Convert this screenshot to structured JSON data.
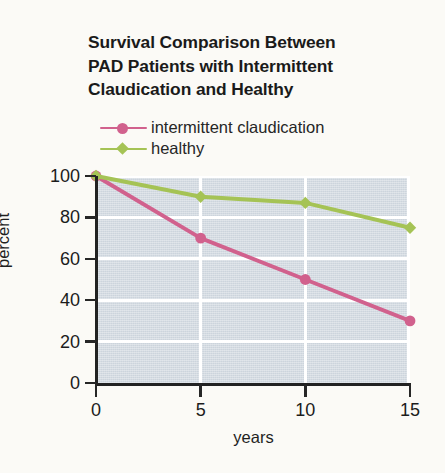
{
  "figure": {
    "background_color": "#fbfaf6"
  },
  "title": {
    "lines": [
      "Survival Comparison Between",
      "PAD Patients with Intermittent",
      "Claudication and Healthy"
    ],
    "full": "Survival Comparison Between PAD Patients with Intermittent Claudication and Healthy"
  },
  "legend": {
    "position": "above-plot-left",
    "entries": [
      {
        "label": "intermittent claudication",
        "color": "#d1618d",
        "marker": "circle"
      },
      {
        "label": "healthy",
        "color": "#a5c355",
        "marker": "diamond"
      }
    ]
  },
  "axes": {
    "x": {
      "label": "years",
      "ticks": [
        "0",
        "5",
        "10",
        "15"
      ],
      "values": [
        0,
        5,
        10,
        15
      ],
      "range": [
        0,
        15
      ]
    },
    "y": {
      "label": "percent",
      "ticks": [
        "0",
        "20",
        "40",
        "60",
        "80",
        "100"
      ],
      "values": [
        0,
        20,
        40,
        60,
        80,
        100
      ],
      "range": [
        0,
        100
      ]
    }
  },
  "plot_style": {
    "panel_color": "#ccd4dc",
    "gridline_color": "#ffffff",
    "axis_color": "#222222"
  },
  "chart_data": {
    "type": "line",
    "title": "Survival Comparison Between PAD Patients with Intermittent Claudication and Healthy",
    "xlabel": "years",
    "ylabel": "percent",
    "x": [
      0,
      5,
      10,
      15
    ],
    "xlim": [
      0,
      15
    ],
    "ylim": [
      0,
      100
    ],
    "grid": true,
    "legend_position": "above plot, left",
    "series": [
      {
        "name": "intermittent claudication",
        "color": "#d1618d",
        "marker": "circle",
        "values": [
          100,
          70,
          50,
          30
        ]
      },
      {
        "name": "healthy",
        "color": "#a5c355",
        "marker": "diamond",
        "values": [
          100,
          90,
          87,
          75
        ]
      }
    ]
  }
}
